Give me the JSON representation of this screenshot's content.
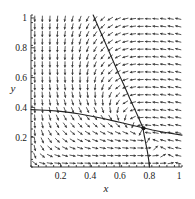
{
  "figure": {
    "title": "",
    "background_color": "#ffffff",
    "line_color": "#222222",
    "arrow_color": "#3a3a3a",
    "axis_color": "#2b2b2b"
  },
  "chart_data": {
    "type": "scatter",
    "subtype": "direction-field-phase-portrait",
    "title": "",
    "subtitle": "",
    "xlabel": "x",
    "ylabel": "y",
    "xlim": [
      0,
      1.02
    ],
    "ylim": [
      0,
      1.02
    ],
    "grid": false,
    "legend": null,
    "legend_position": "none",
    "x_ticks": [
      0.2,
      0.4,
      0.6,
      0.8,
      1
    ],
    "x_tick_labels": [
      "0.2",
      "0.4",
      "0.6",
      "0.8",
      "1"
    ],
    "y_ticks": [
      0.2,
      0.4,
      0.6,
      0.8,
      1
    ],
    "y_tick_labels": [
      "0.2",
      "0.4",
      "0.6",
      "0.8",
      "1"
    ],
    "x_minor_tick_count": 20,
    "y_minor_tick_count": 20,
    "vector_field": {
      "description": "Grid of unit direction arrows showing flow toward a saddle point",
      "grid_nx": 20,
      "grid_ny": 20,
      "arrow_length": 6.2,
      "model": "dx = x*(1 - x - a*y), dy = y*(b*x - c)",
      "params": {
        "a": 1.15,
        "b": 1.0,
        "c": 0.76
      }
    },
    "fixed_points": [
      {
        "x": 0.76,
        "y": 0.26,
        "kind": "saddle",
        "marked": true
      }
    ],
    "curves": [
      {
        "name": "x-nullcline-upper-branch",
        "style": "solid",
        "points": [
          [
            0.42,
            1.02
          ],
          [
            0.455,
            0.94
          ],
          [
            0.49,
            0.86
          ],
          [
            0.525,
            0.78
          ],
          [
            0.56,
            0.7
          ],
          [
            0.595,
            0.62
          ],
          [
            0.63,
            0.545
          ],
          [
            0.665,
            0.465
          ],
          [
            0.695,
            0.4
          ],
          [
            0.72,
            0.345
          ],
          [
            0.742,
            0.295
          ],
          [
            0.756,
            0.265
          ]
        ]
      },
      {
        "name": "y-nullcline-shallow-branch",
        "style": "solid",
        "points": [
          [
            0.0,
            0.385
          ],
          [
            0.06,
            0.383
          ],
          [
            0.13,
            0.379
          ],
          [
            0.2,
            0.373
          ],
          [
            0.27,
            0.365
          ],
          [
            0.34,
            0.354
          ],
          [
            0.41,
            0.341
          ],
          [
            0.48,
            0.327
          ],
          [
            0.55,
            0.311
          ],
          [
            0.62,
            0.295
          ],
          [
            0.69,
            0.279
          ],
          [
            0.756,
            0.263
          ],
          [
            0.82,
            0.248
          ],
          [
            0.88,
            0.236
          ],
          [
            0.94,
            0.226
          ],
          [
            1.02,
            0.214
          ]
        ]
      },
      {
        "name": "separatrix-descending-to-axis",
        "style": "solid",
        "points": [
          [
            0.756,
            0.263
          ],
          [
            0.762,
            0.225
          ],
          [
            0.77,
            0.185
          ],
          [
            0.778,
            0.145
          ],
          [
            0.786,
            0.105
          ],
          [
            0.792,
            0.068
          ],
          [
            0.797,
            0.033
          ],
          [
            0.8,
            0.0
          ]
        ]
      }
    ]
  }
}
